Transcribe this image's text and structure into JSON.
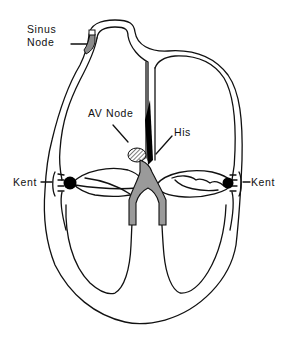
{
  "diagram": {
    "type": "heart-conduction-anatomy",
    "labels": {
      "sinus_node_line1": "Sinus",
      "sinus_node_line2": "Node",
      "av_node": "AV Node",
      "his": "His",
      "kent_left": "Kent",
      "kent_right": "Kent"
    },
    "colors": {
      "outline": "#111111",
      "background": "#ffffff",
      "conduction_fill": "#9a9a9a",
      "node_fill": "#000000"
    }
  }
}
